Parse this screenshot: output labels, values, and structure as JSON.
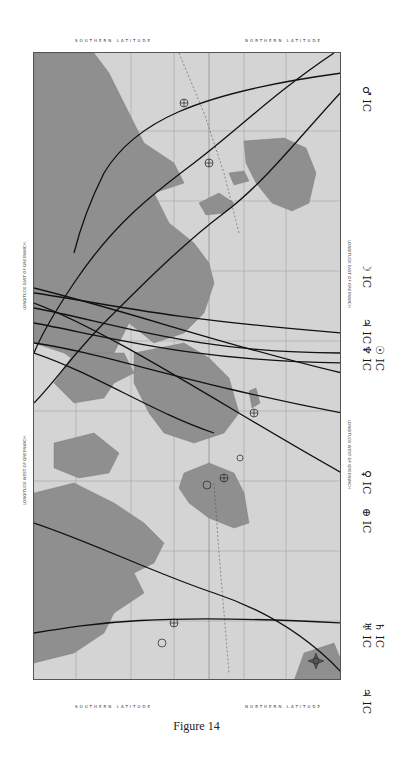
{
  "figure": {
    "caption": "Figure 14",
    "type": "rotated world map (Mercator) with astrocartography planetary lines"
  },
  "map": {
    "orientation": "rotated 90 degrees clockwise",
    "top_edge_labels": {
      "left": "SOUTHERN LATITUDE",
      "right": "NORTHERN LATITUDE"
    },
    "bottom_edge_labels": {
      "left": "SOUTHERN LATITUDE",
      "right": "NORTHERN LATITUDE"
    },
    "left_edge_labels": {
      "upper": "LONGITUDE EAST OF GREENWICH",
      "lower": "LONGITUDE WEST OF GREENWICH"
    },
    "right_edge_labels": {
      "upper": "LONGITUDE EAST OF GREENWICH",
      "lower": "LONGITUDE WEST OF GREENWICH"
    },
    "ocean_labels": [
      "PACIFIC OCEAN",
      "ATLANTIC OCEAN",
      "INDIAN OCEAN",
      "ARABIAN SEA",
      "PACIFIC OCEAN"
    ],
    "colors": {
      "land": "#8f8f8f",
      "ocean": "#d4d4d4",
      "lines": "#111111",
      "grid": "#9a9a9a"
    }
  },
  "planet_lines": [
    {
      "symbol": "♂",
      "angle": "IC",
      "label": "♂ IC"
    },
    {
      "symbol": "☽",
      "angle": "IC",
      "label": "☽ IC"
    },
    {
      "symbol": "♃",
      "angle": "IC",
      "label": "♃ IC"
    },
    {
      "symbol": "♆",
      "angle": "IC",
      "label": "♆ IC"
    },
    {
      "symbol": "☉",
      "angle": "IC",
      "label": "☉ IC"
    },
    {
      "symbol": "♀",
      "angle": "IC",
      "label": "♀ IC"
    },
    {
      "symbol": "⊕",
      "angle": "IC",
      "label": "⊕ IC"
    },
    {
      "symbol": "♅",
      "angle": "IC",
      "label": "♅ IC"
    },
    {
      "symbol": "♄",
      "angle": "IC",
      "label": "♄ IC"
    },
    {
      "symbol": "♃",
      "angle": "IC",
      "label": "♃ IC"
    }
  ]
}
